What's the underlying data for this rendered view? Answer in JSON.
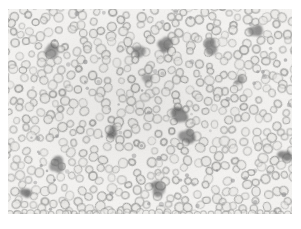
{
  "figure": {
    "kind": "photomicrograph",
    "specimen": "peripheral blood smear",
    "caption": "",
    "page_background": "#ffffff",
    "plate": {
      "x": 8,
      "y": 9,
      "width": 284,
      "height": 205,
      "background": "#f5f4f2"
    },
    "caption_box": {
      "x": 9,
      "y": 218,
      "width": 140,
      "height": 8
    }
  },
  "palette": {
    "page": "#ffffff",
    "plate_background": "#f5f4f2",
    "erythrocyte_rim": "#9a9a98",
    "erythrocyte_rim_dark": "#88888a",
    "erythrocyte_pallor": "#ebeae7",
    "leukocyte": "#6b6b6b",
    "leukocyte_dark": "#575757",
    "caption_text": "#b4b4b2"
  },
  "chart_data": {
    "type": "scatter",
    "title": "",
    "subtitle": "",
    "xlabel": "",
    "ylabel": "",
    "xlim": [
      0,
      284
    ],
    "ylim": [
      0,
      205
    ],
    "grid": false,
    "legend_position": "none",
    "annotations": [],
    "field": {
      "width": 284,
      "height": 205,
      "random_seed": 20240517
    },
    "series": [
      {
        "name": "erythrocytes",
        "role": "red-blood-cell",
        "count": 620,
        "radius_range": [
          3.0,
          4.6
        ],
        "ring_thickness_range": [
          1.0,
          1.7
        ],
        "opacity_range": [
          0.45,
          0.92
        ],
        "fill": "#ebeae7",
        "stroke": "#9a9a98",
        "min_separation": 6.2,
        "placement": "poisson-jitter-grid"
      },
      {
        "name": "leukocytes",
        "role": "white-blood-cell",
        "count": 14,
        "fill": "#6b6b6b",
        "opacity_range": [
          0.5,
          0.82
        ],
        "blur": 1.1,
        "points": [
          {
            "x": 44,
            "y": 42,
            "r": 8.0,
            "lobes": 4,
            "opacity": 0.62
          },
          {
            "x": 131,
            "y": 42,
            "r": 7.4,
            "lobes": 4,
            "opacity": 0.66
          },
          {
            "x": 157,
            "y": 36,
            "r": 7.8,
            "lobes": 3,
            "opacity": 0.7
          },
          {
            "x": 203,
            "y": 38,
            "r": 8.6,
            "lobes": 4,
            "opacity": 0.68
          },
          {
            "x": 248,
            "y": 22,
            "r": 7.8,
            "lobes": 3,
            "opacity": 0.64
          },
          {
            "x": 139,
            "y": 68,
            "r": 5.6,
            "lobes": 3,
            "opacity": 0.52
          },
          {
            "x": 172,
            "y": 105,
            "r": 8.8,
            "lobes": 4,
            "opacity": 0.74
          },
          {
            "x": 178,
            "y": 127,
            "r": 8.2,
            "lobes": 4,
            "opacity": 0.7
          },
          {
            "x": 104,
            "y": 122,
            "r": 7.0,
            "lobes": 3,
            "opacity": 0.72
          },
          {
            "x": 50,
            "y": 155,
            "r": 8.4,
            "lobes": 4,
            "opacity": 0.66
          },
          {
            "x": 18,
            "y": 182,
            "r": 6.6,
            "lobes": 3,
            "opacity": 0.78
          },
          {
            "x": 151,
            "y": 178,
            "r": 8.0,
            "lobes": 4,
            "opacity": 0.64
          },
          {
            "x": 276,
            "y": 148,
            "r": 7.6,
            "lobes": 3,
            "opacity": 0.7
          },
          {
            "x": 232,
            "y": 72,
            "r": 5.0,
            "lobes": 3,
            "opacity": 0.5
          }
        ]
      }
    ]
  }
}
